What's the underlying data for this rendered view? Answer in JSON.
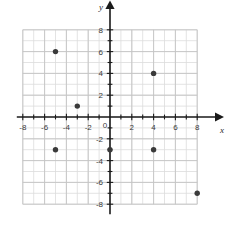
{
  "figure": {
    "type": "coordinate-plane",
    "background_color": "#ffffff"
  },
  "axes": {
    "x_axis_name": "x",
    "y_axis_name": "y",
    "origin_label": "0",
    "axis_color": "#1a1a1a",
    "grid_color": "#dcdcdc",
    "grid_major_color": "#c4c4c4",
    "x_tick_labels": [
      "-8",
      "-6",
      "-4",
      "-2",
      "2",
      "4",
      "6",
      "8"
    ],
    "y_tick_labels": [
      "8",
      "6",
      "4",
      "2",
      "-2",
      "-4",
      "-6",
      "-8"
    ]
  },
  "chart_data": {
    "type": "scatter",
    "title": "",
    "xlabel": "x",
    "ylabel": "y",
    "xlim": [
      -8,
      8
    ],
    "ylim": [
      -8,
      8
    ],
    "xticks": [
      -8,
      -6,
      -4,
      -2,
      0,
      2,
      4,
      6,
      8
    ],
    "yticks": [
      -8,
      -6,
      -4,
      -2,
      0,
      2,
      4,
      6,
      8
    ],
    "minor_tick_step": 1,
    "grid": true,
    "legend": false,
    "point_color": "#3a3a3a",
    "points": [
      {
        "x": -5,
        "y": 6
      },
      {
        "x": -3,
        "y": 1
      },
      {
        "x": 4,
        "y": 4
      },
      {
        "x": -5,
        "y": -3
      },
      {
        "x": 0,
        "y": -3
      },
      {
        "x": 4,
        "y": -3
      },
      {
        "x": 8,
        "y": -7
      }
    ]
  }
}
